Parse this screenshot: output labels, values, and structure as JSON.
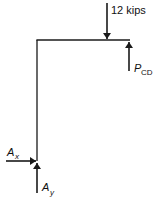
{
  "diagram": {
    "type": "free-body-diagram",
    "colors": {
      "stroke": "#1a1a1a",
      "background": "#ffffff"
    },
    "loads": {
      "applied_force": {
        "value": "12 kips",
        "direction": "down"
      },
      "member_force": {
        "symbol": "P",
        "subscript": "CD",
        "direction": "up"
      }
    },
    "reactions": {
      "horizontal": {
        "symbol": "A",
        "subscript": "x",
        "direction": "right"
      },
      "vertical": {
        "symbol": "A",
        "subscript": "y",
        "direction": "up"
      }
    }
  }
}
